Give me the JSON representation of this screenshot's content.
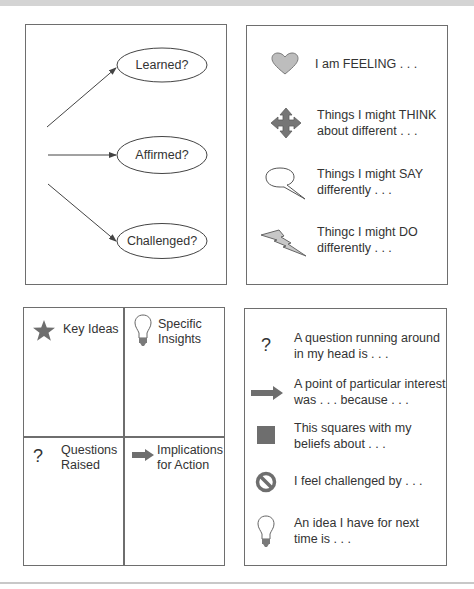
{
  "reflection_diagram": {
    "nodes": [
      {
        "label": "Learned?"
      },
      {
        "label": "Affirmed?"
      },
      {
        "label": "Challenged?"
      }
    ]
  },
  "prompts_panel": {
    "items": [
      {
        "icon": "heart-icon",
        "line1": "I am FEELING . . .",
        "line2": ""
      },
      {
        "icon": "four-way-arrow-icon",
        "line1": "Things I might THINK",
        "line2": "about different . . ."
      },
      {
        "icon": "speech-bubble-icon",
        "line1": "Things I might SAY",
        "line2": "differently . . ."
      },
      {
        "icon": "lightning-bolt-icon",
        "line1": "Thingc I might DO",
        "line2": "differently . . ."
      }
    ]
  },
  "quadrant_grid": {
    "cells": [
      {
        "icon": "star-icon",
        "line1": "Key Ideas",
        "line2": ""
      },
      {
        "icon": "light-bulb-icon",
        "line1": "Specific",
        "line2": "Insights"
      },
      {
        "icon": "question-mark-icon",
        "glyph": "?",
        "line1": "Questions",
        "line2": "Raised"
      },
      {
        "icon": "right-arrow-icon",
        "line1": "Implications",
        "line2": "for Action"
      }
    ]
  },
  "sentence_starters": {
    "items": [
      {
        "icon": "question-mark-icon",
        "glyph": "?",
        "line1": "A question running around",
        "line2": "in my head is . . ."
      },
      {
        "icon": "right-arrow-icon",
        "line1": "A point of particular interest",
        "line2": "was . . . because . . ."
      },
      {
        "icon": "square-icon",
        "line1": "This squares with my",
        "line2": "beliefs about . . ."
      },
      {
        "icon": "prohibited-icon",
        "line1": "I feel challenged by . . .",
        "line2": ""
      },
      {
        "icon": "light-bulb-icon",
        "line1": "An idea I have for next",
        "line2": "time is . . ."
      }
    ]
  },
  "colors": {
    "border": "#6e6e6e",
    "icon_fill": "#8a8a8a",
    "icon_light_fill": "#c4c4c4",
    "text": "#333333"
  }
}
